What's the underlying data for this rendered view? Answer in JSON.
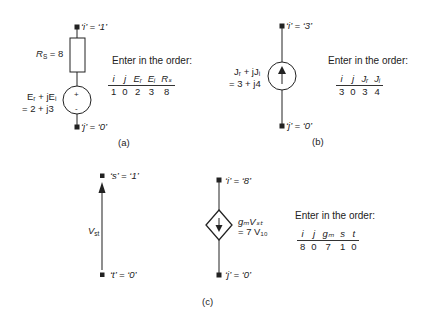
{
  "figure": {
    "panels": [
      {
        "id": "a",
        "caption": "(a)",
        "element": "voltage source with series resistor",
        "top_terminal": "‘i’ = ‘1’",
        "bottom_terminal": "‘j’ = ‘0’",
        "resistor_label": "R",
        "resistor_sub": "S",
        "resistor_value": "= 8",
        "source_label_line1": "Eᵣ + jEᵢ",
        "source_label_line2": "= 2 + j3",
        "plus": "+",
        "minus": "-",
        "order_title": "Enter in the order:",
        "headers": [
          "i",
          "j",
          "Eᵣ",
          "Eᵢ",
          "Rₛ"
        ],
        "values": [
          "1",
          "0",
          "2",
          "3",
          "8"
        ]
      },
      {
        "id": "b",
        "caption": "(b)",
        "element": "current source",
        "top_terminal": "‘i’ = ‘3’",
        "bottom_terminal": "‘j’ = ‘0’",
        "source_label_line1": "Jᵣ + jJᵢ",
        "source_label_line2": "= 3 + j4",
        "order_title": "Enter in the order:",
        "headers": [
          "i",
          "j",
          "Jᵣ",
          "Jᵢ"
        ],
        "values": [
          "3",
          "0",
          "3",
          "4"
        ]
      },
      {
        "id": "c",
        "caption": "(c)",
        "element": "voltage-controlled current source",
        "control_top": "‘s’ = ‘1’",
        "control_bottom": "‘t’ = ‘0’",
        "control_label": "V",
        "control_sub": "st",
        "top_terminal": "‘i’ = ‘8’",
        "bottom_terminal": "‘j’ = ‘0’",
        "source_label_line1": "gₘVₛₜ",
        "source_label_line2": "= 7 V₁₀",
        "order_title": "Enter in the order:",
        "headers": [
          "i",
          "j",
          "gₘ",
          "s",
          "t"
        ],
        "values": [
          "8",
          "0",
          "7",
          "1",
          "0"
        ]
      }
    ]
  }
}
